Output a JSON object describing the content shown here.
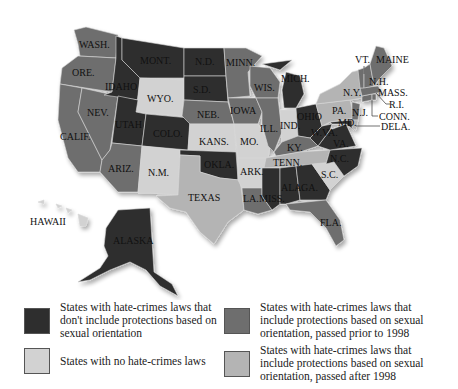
{
  "map": {
    "title": "",
    "colors": {
      "no_protection": "#2e2e2e",
      "none": "#d2d2d2",
      "prior_1998": "#6e6e6e",
      "after_1998": "#b4b4b4"
    },
    "state_labels": {
      "wash": "WASH.",
      "ore": "ORE.",
      "calif": "CALIF.",
      "nev": "NEV.",
      "idaho": "IDAHO",
      "mont": "MONT.",
      "wyo": "WYO.",
      "utah": "UTAH",
      "colo": "COLO.",
      "ariz": "ARIZ.",
      "nm": "N.M.",
      "nd": "N.D.",
      "sd": "S.D.",
      "neb": "NEB.",
      "kans": "KANS.",
      "okla": "OKLA.",
      "texas": "TEXAS",
      "minn": "MINN.",
      "iowa": "IOWA",
      "mo": "MO.",
      "ark": "ARK.",
      "la": "LA.",
      "wis": "WIS.",
      "ill": "ILL.",
      "mich": "MICH.",
      "ind": "IND.",
      "ohio": "OHIO",
      "ky": "KY.",
      "tenn": "TENN.",
      "miss": "MISS.",
      "ala": "ALA.",
      "ga": "GA.",
      "fla": "FLA.",
      "sc": "S.C.",
      "nc": "N.C.",
      "va": "VA.",
      "wva": "W.VA.",
      "md": "MD.",
      "pa": "PA.",
      "ny": "N.Y.",
      "nj": "N.J.",
      "dela": "DELA.",
      "conn": "CONN.",
      "ri": "R.I.",
      "mass": "MASS.",
      "vt": "VT.",
      "nh": "N.H.",
      "maine": "MAINE",
      "hawaii": "HAWAII",
      "alaska": "ALASKA"
    },
    "categories": {
      "no_protection": [
        "IDAHO",
        "MONT.",
        "UTAH",
        "COLO.",
        "N.D.",
        "S.D.",
        "OKLA.",
        "MICH.",
        "OHIO",
        "W.VA.",
        "VA.",
        "N.C.",
        "ALA.",
        "GA.",
        "MISS.",
        "ALASKA",
        "MD."
      ],
      "none": [
        "WYO.",
        "KANS.",
        "N.M.",
        "ARK.",
        "S.C.",
        "IND.",
        "MO.",
        "HAWAII"
      ],
      "prior_1998": [
        "WASH.",
        "ORE.",
        "CALIF.",
        "NEV.",
        "ARIZ.",
        "NEB.",
        "MINN.",
        "IOWA",
        "WIS.",
        "ILL.",
        "KY.",
        "LA.",
        "FLA.",
        "VT.",
        "N.H.",
        "MAINE",
        "MASS.",
        "R.I.",
        "CONN.",
        "N.J."
      ],
      "after_1998": [
        "TEXAS",
        "TENN.",
        "N.Y.",
        "PA.",
        "DELA."
      ]
    }
  },
  "legend": {
    "items": [
      {
        "key": "no_protection",
        "label": "States with hate-crimes laws that don't include protections based on sexual orientation"
      },
      {
        "key": "prior_1998",
        "label": "States with hate-crimes laws that include protections based on sexual orientation, passed prior to 1998"
      },
      {
        "key": "none",
        "label": "States with no hate-crimes laws"
      },
      {
        "key": "after_1998",
        "label": "States with hate-crimes laws that include protections based on sexual orientation, passed after 1998"
      }
    ]
  }
}
